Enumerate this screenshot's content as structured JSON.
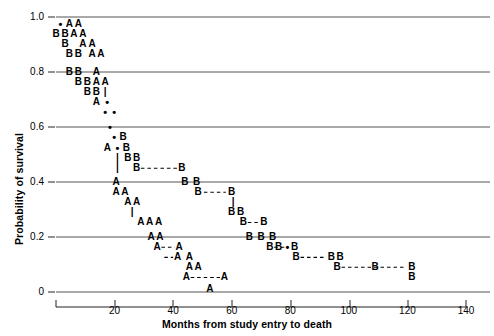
{
  "chart_data": {
    "type": "scatter",
    "title": "",
    "xlabel": "Months from study entry to death",
    "ylabel": "Probability of survival",
    "xlim": [
      0,
      140
    ],
    "ylim": [
      0,
      1.0
    ],
    "xticks": [
      0,
      20,
      40,
      60,
      80,
      100,
      120,
      140
    ],
    "xtick_labels": [
      "",
      "20",
      "40",
      "60",
      "80",
      "100",
      "120",
      "140"
    ],
    "yticks": [
      0,
      0.2,
      0.4,
      0.6,
      0.8,
      1.0
    ],
    "ytick_labels": [
      "0",
      "0.2",
      "0.4",
      "0.6",
      "0.8",
      "1.0"
    ],
    "grid": "horizontal",
    "legend": "none",
    "series": [
      {
        "name": "A",
        "marker": "A",
        "description": "Group A survival step curve"
      },
      {
        "name": "B",
        "marker": "B",
        "description": "Group B survival step curve"
      },
      {
        "name": "censored",
        "marker": "•",
        "description": "Censored observation dots"
      }
    ],
    "markers": [
      {
        "label": "•",
        "x": 1.5,
        "y": 0.975
      },
      {
        "label": "A",
        "x": 4.6,
        "y": 0.975
      },
      {
        "label": "A",
        "x": 7.6,
        "y": 0.975
      },
      {
        "label": "B",
        "x": 0.0,
        "y": 0.938
      },
      {
        "label": "B",
        "x": 3.1,
        "y": 0.938
      },
      {
        "label": "A",
        "x": 6.1,
        "y": 0.938
      },
      {
        "label": "A",
        "x": 9.2,
        "y": 0.938
      },
      {
        "label": "B",
        "x": 3.1,
        "y": 0.901
      },
      {
        "label": "A",
        "x": 9.2,
        "y": 0.901
      },
      {
        "label": "A",
        "x": 12.3,
        "y": 0.901
      },
      {
        "label": "B",
        "x": 4.6,
        "y": 0.864
      },
      {
        "label": "B",
        "x": 7.6,
        "y": 0.864
      },
      {
        "label": "A",
        "x": 12.3,
        "y": 0.864
      },
      {
        "label": "A",
        "x": 15.3,
        "y": 0.864
      },
      {
        "label": "B",
        "x": 4.6,
        "y": 0.8
      },
      {
        "label": "B",
        "x": 7.6,
        "y": 0.8
      },
      {
        "label": "A",
        "x": 13.8,
        "y": 0.8
      },
      {
        "label": "B",
        "x": 7.6,
        "y": 0.763
      },
      {
        "label": "B",
        "x": 10.7,
        "y": 0.763
      },
      {
        "label": "A",
        "x": 13.8,
        "y": 0.763
      },
      {
        "label": "A",
        "x": 16.8,
        "y": 0.763
      },
      {
        "label": "B",
        "x": 10.7,
        "y": 0.727
      },
      {
        "label": "B",
        "x": 13.8,
        "y": 0.727
      },
      {
        "label": "|",
        "x": 16.8,
        "y": 0.727
      },
      {
        "label": "A",
        "x": 13.8,
        "y": 0.69
      },
      {
        "label": "•",
        "x": 17.5,
        "y": 0.69
      },
      {
        "label": "•",
        "x": 16.8,
        "y": 0.653
      },
      {
        "label": "•",
        "x": 19.9,
        "y": 0.653
      },
      {
        "label": "•",
        "x": 18.4,
        "y": 0.6
      },
      {
        "label": "•",
        "x": 19.9,
        "y": 0.562
      },
      {
        "label": "B",
        "x": 22.9,
        "y": 0.562
      },
      {
        "label": "A",
        "x": 17.5,
        "y": 0.525
      },
      {
        "label": "•",
        "x": 21.0,
        "y": 0.525
      },
      {
        "label": "B",
        "x": 24.0,
        "y": 0.525
      },
      {
        "label": "|",
        "x": 21.0,
        "y": 0.488
      },
      {
        "label": "B",
        "x": 24.5,
        "y": 0.488
      },
      {
        "label": "B",
        "x": 27.5,
        "y": 0.488
      },
      {
        "label": "|",
        "x": 21.0,
        "y": 0.45
      },
      {
        "label": "B",
        "x": 27.5,
        "y": 0.45
      },
      {
        "label": "B",
        "x": 43.0,
        "y": 0.45
      },
      {
        "label": "A",
        "x": 20.5,
        "y": 0.4
      },
      {
        "label": "B",
        "x": 44.0,
        "y": 0.4
      },
      {
        "label": "B",
        "x": 48.0,
        "y": 0.4
      },
      {
        "label": "A",
        "x": 20.5,
        "y": 0.363
      },
      {
        "label": "A",
        "x": 23.5,
        "y": 0.363
      },
      {
        "label": "B",
        "x": 48.5,
        "y": 0.363
      },
      {
        "label": "B",
        "x": 60.0,
        "y": 0.363
      },
      {
        "label": "A",
        "x": 24.5,
        "y": 0.326
      },
      {
        "label": "A",
        "x": 27.5,
        "y": 0.326
      },
      {
        "label": "|",
        "x": 60.5,
        "y": 0.326
      },
      {
        "label": "|",
        "x": 26.0,
        "y": 0.29
      },
      {
        "label": "B",
        "x": 60.0,
        "y": 0.29
      },
      {
        "label": "B",
        "x": 63.0,
        "y": 0.29
      },
      {
        "label": "A",
        "x": 29.0,
        "y": 0.253
      },
      {
        "label": "A",
        "x": 32.0,
        "y": 0.253
      },
      {
        "label": "A",
        "x": 35.0,
        "y": 0.253
      },
      {
        "label": "B",
        "x": 64.0,
        "y": 0.253
      },
      {
        "label": "B",
        "x": 71.0,
        "y": 0.253
      },
      {
        "label": "A",
        "x": 32.5,
        "y": 0.2
      },
      {
        "label": "A",
        "x": 35.5,
        "y": 0.2
      },
      {
        "label": "B",
        "x": 66.0,
        "y": 0.2
      },
      {
        "label": "B",
        "x": 70.0,
        "y": 0.2
      },
      {
        "label": "B",
        "x": 74.0,
        "y": 0.2
      },
      {
        "label": "A",
        "x": 34.5,
        "y": 0.163
      },
      {
        "label": "A",
        "x": 42.0,
        "y": 0.163
      },
      {
        "label": "B",
        "x": 73.0,
        "y": 0.163
      },
      {
        "label": "B",
        "x": 76.0,
        "y": 0.163
      },
      {
        "label": "•",
        "x": 79.0,
        "y": 0.163
      },
      {
        "label": "B",
        "x": 81.5,
        "y": 0.163
      },
      {
        "label": "A",
        "x": 41.5,
        "y": 0.126
      },
      {
        "label": "A",
        "x": 45.5,
        "y": 0.126
      },
      {
        "label": "B",
        "x": 82.0,
        "y": 0.126
      },
      {
        "label": "B",
        "x": 94.0,
        "y": 0.126
      },
      {
        "label": "B",
        "x": 97.0,
        "y": 0.126
      },
      {
        "label": "A",
        "x": 45.5,
        "y": 0.09
      },
      {
        "label": "A",
        "x": 48.5,
        "y": 0.09
      },
      {
        "label": "B",
        "x": 96.0,
        "y": 0.09
      },
      {
        "label": "B",
        "x": 109.0,
        "y": 0.09
      },
      {
        "label": "B",
        "x": 121.5,
        "y": 0.09
      },
      {
        "label": "A",
        "x": 44.5,
        "y": 0.053
      },
      {
        "label": "A",
        "x": 57.5,
        "y": 0.053
      },
      {
        "label": "B",
        "x": 121.5,
        "y": 0.053
      },
      {
        "label": "A",
        "x": 52.5,
        "y": 0.01
      }
    ],
    "connectors": [
      {
        "type": "h",
        "y": 0.45,
        "x1": 29.0,
        "x2": 41.5
      },
      {
        "type": "h",
        "y": 0.363,
        "x1": 50.5,
        "x2": 58.0
      },
      {
        "type": "h",
        "y": 0.253,
        "x1": 65.5,
        "x2": 69.5
      },
      {
        "type": "h",
        "y": 0.163,
        "x1": 74.5,
        "x2": 79.0
      },
      {
        "type": "h",
        "y": 0.126,
        "x1": 83.5,
        "x2": 92.0
      },
      {
        "type": "h",
        "y": 0.09,
        "x1": 97.5,
        "x2": 119.5
      },
      {
        "type": "h",
        "y": 0.163,
        "x1": 36.0,
        "x2": 40.5
      },
      {
        "type": "h",
        "y": 0.126,
        "x1": 37.0,
        "x2": 40.0
      },
      {
        "type": "h",
        "y": 0.053,
        "x1": 46.0,
        "x2": 56.0
      }
    ]
  }
}
